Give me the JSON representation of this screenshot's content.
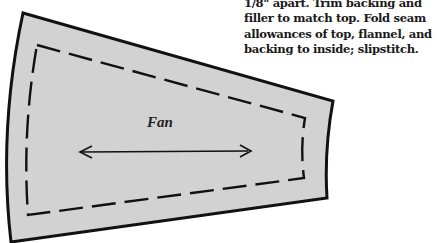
{
  "instructions": {
    "lines": [
      "1/8\" apart.  Trim backing and",
      "filler to match top.  Fold seam",
      "allowances of top, flannel, and",
      "backing to inside; slipstitch."
    ]
  },
  "pattern": {
    "piece_label": "Fan",
    "fill_color": "#d2d2d2",
    "outline_color": "#111111",
    "seam_line_style": "dashed",
    "grainline_arrow": "double-headed horizontal"
  }
}
